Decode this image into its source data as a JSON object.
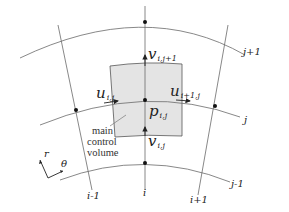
{
  "diagram": {
    "grid_lines": {
      "radial": [
        "i-1",
        "i",
        "i+1"
      ],
      "circumferential": [
        "j-1",
        "j",
        "j+1"
      ]
    },
    "labels": {
      "i_minus_1": "i-1",
      "i": "i",
      "i_plus_1": "i+1",
      "j_minus_1": "j-1",
      "j": "j",
      "j_plus_1": "j+1"
    },
    "variables": {
      "pressure": {
        "symbol": "p",
        "subscript": "i,j"
      },
      "u_left": {
        "symbol": "u",
        "subscript": "i,j"
      },
      "u_right": {
        "symbol": "u",
        "subscript": "i+1,j"
      },
      "v_top": {
        "symbol": "v",
        "subscript": "i,j+1"
      },
      "v_bottom": {
        "symbol": "v",
        "subscript": "i,j"
      }
    },
    "control_volume": {
      "label_lines": [
        "main",
        "control",
        "volume"
      ],
      "fill": "#e4e4e4"
    },
    "axes": {
      "r": "r",
      "theta": "θ"
    }
  }
}
